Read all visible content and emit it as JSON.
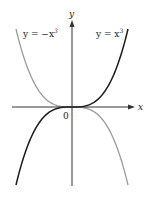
{
  "chart_data": {
    "type": "line",
    "title": "",
    "xlabel": "x",
    "ylabel": "y",
    "origin_label": "0",
    "grid": false,
    "legend": "inline annotations",
    "xlim": [
      -1.25,
      1.25
    ],
    "ylim": [
      -1.9,
      1.9
    ],
    "series": [
      {
        "name": "y = x^3",
        "label": "y = x³",
        "color": "#1a1a1a",
        "x": [
          -1.2,
          -1.0,
          -0.8,
          -0.6,
          -0.4,
          -0.2,
          0,
          0.2,
          0.4,
          0.6,
          0.8,
          1.0,
          1.2
        ],
        "y": [
          -1.728,
          -1.0,
          -0.512,
          -0.216,
          -0.064,
          -0.008,
          0,
          0.008,
          0.064,
          0.216,
          0.512,
          1.0,
          1.728
        ]
      },
      {
        "name": "y = -x^3",
        "label": "y = −x³",
        "color": "#9a9a9a",
        "x": [
          -1.2,
          -1.0,
          -0.8,
          -0.6,
          -0.4,
          -0.2,
          0,
          0.2,
          0.4,
          0.6,
          0.8,
          1.0,
          1.2
        ],
        "y": [
          1.728,
          1.0,
          0.512,
          0.216,
          0.064,
          0.008,
          0,
          -0.008,
          -0.064,
          -0.216,
          -0.512,
          -1.0,
          -1.728
        ]
      }
    ]
  },
  "labels": {
    "x_axis": "x",
    "y_axis": "y",
    "origin": "0",
    "curve_pos": "y = x",
    "curve_neg": "y = −x",
    "exponent": "3"
  }
}
